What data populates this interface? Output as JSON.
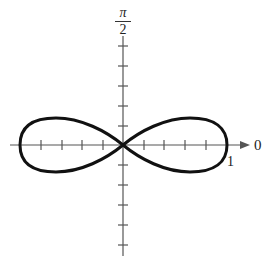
{
  "figure": {
    "type": "polar-graph",
    "curve": "lemniscate",
    "labels": {
      "top_axis_num": "π",
      "top_axis_den": "2",
      "right_axis": "0",
      "radius_tick": "1"
    },
    "colors": {
      "curve": "#111111",
      "axis": "#555555",
      "text": "#222222"
    },
    "ticks": {
      "horizontal_per_side": 5,
      "vertical_up": 5,
      "vertical_down": 5
    }
  }
}
